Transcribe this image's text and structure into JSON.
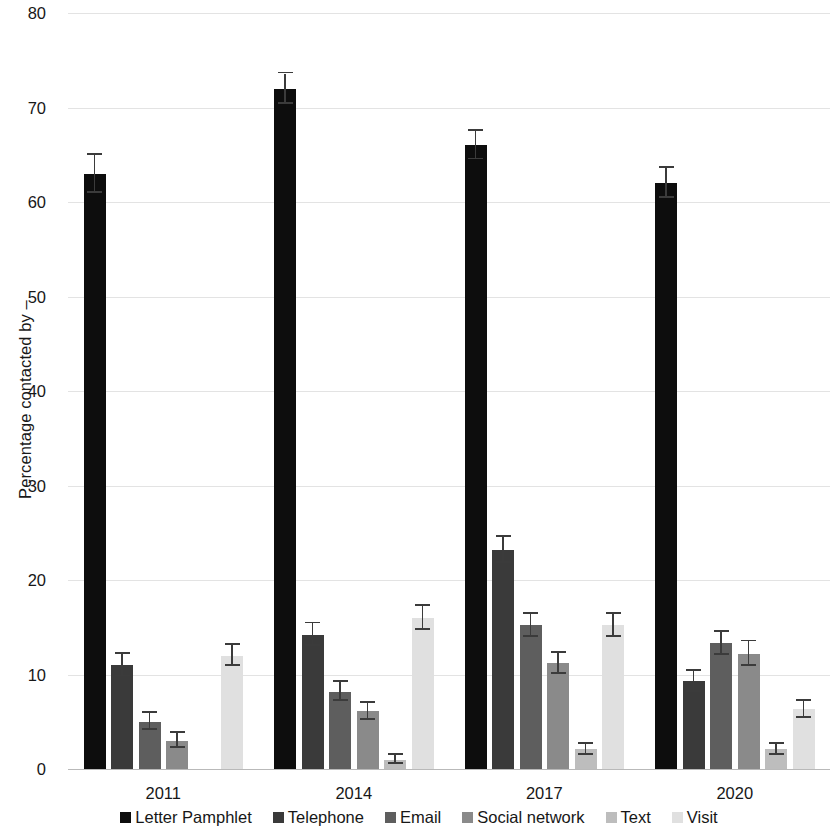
{
  "chart_data": {
    "type": "bar",
    "title": "",
    "subtitle": "",
    "xlabel": "",
    "ylabel": "Percentage contacted by –",
    "categories": [
      "2011",
      "2014",
      "2017",
      "2020"
    ],
    "ylim": [
      0,
      80
    ],
    "yticks": [
      0,
      10,
      20,
      30,
      40,
      50,
      60,
      70,
      80
    ],
    "ytick_labels": [
      "0",
      "10",
      "20",
      "30",
      "40",
      "50",
      "60",
      "70",
      "80"
    ],
    "grid": true,
    "legend_position": "bottom",
    "error_bars": true,
    "series": [
      {
        "name": "Letter Pamphlet",
        "color": "#0d0d0d",
        "values": [
          63,
          72,
          66,
          62
        ],
        "err_low": [
          2,
          1.6,
          1.5,
          1.6
        ],
        "err_high": [
          2,
          1.6,
          1.5,
          1.6
        ]
      },
      {
        "name": "Telephone",
        "color": "#3a3a3a",
        "values": [
          11,
          14.2,
          23.2,
          9.3
        ],
        "err_low": [
          1.2,
          1.2,
          1.4,
          1.1
        ],
        "err_high": [
          1.2,
          1.2,
          1.4,
          1.1
        ]
      },
      {
        "name": "Email",
        "color": "#5e5e5e",
        "values": [
          5,
          8.2,
          15.2,
          13.3
        ],
        "err_low": [
          0.9,
          1.0,
          1.2,
          1.2
        ],
        "err_high": [
          0.9,
          1.0,
          1.2,
          1.2
        ]
      },
      {
        "name": "Social network",
        "color": "#8a8a8a",
        "values": [
          3,
          6.1,
          11.2,
          12.2
        ],
        "err_low": [
          0.8,
          0.9,
          1.1,
          1.3
        ],
        "err_high": [
          0.8,
          0.9,
          1.1,
          1.3
        ]
      },
      {
        "name": "Text",
        "color": "#bdbdbd",
        "values": [
          0,
          1.0,
          2.1,
          2.1
        ],
        "err_low": [
          0,
          0.5,
          0.6,
          0.6
        ],
        "err_high": [
          0,
          0.5,
          0.6,
          0.6
        ]
      },
      {
        "name": "Visit",
        "color": "#e0e0e0",
        "values": [
          12,
          16,
          15.2,
          6.3
        ],
        "err_low": [
          1.1,
          1.3,
          1.2,
          0.9
        ],
        "err_high": [
          1.1,
          1.3,
          1.2,
          0.9
        ]
      }
    ]
  }
}
